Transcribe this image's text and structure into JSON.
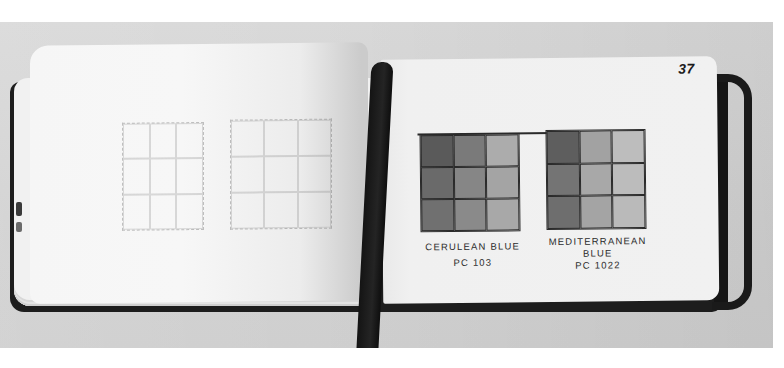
{
  "scene": {
    "description": "Open sketchbook with colored pencil swatch grids",
    "page_number": "37"
  },
  "left_page": {
    "grids": [
      {
        "name": "faint-grid-1",
        "cells": 9
      },
      {
        "name": "faint-grid-2",
        "cells": 9
      }
    ]
  },
  "right_page": {
    "swatches": [
      {
        "name": "cerulean-blue",
        "label_line1": "CERULEAN BLUE",
        "label_line2": "PC 103",
        "cells": [
          "#5a5a5a",
          "#7a7a7a",
          "#acacac",
          "#6a6a6a",
          "#868686",
          "#a4a4a4",
          "#707070",
          "#8a8a8a",
          "#a8a8a8"
        ]
      },
      {
        "name": "mediterranean-blue",
        "label_line1": "MEDITERRANEAN",
        "label_line2": "BLUE",
        "label_line3": "PC 1022",
        "cells": [
          "#5e5e5e",
          "#a2a2a2",
          "#bdbdbd",
          "#747474",
          "#a8a8a8",
          "#bcbcbc",
          "#6e6e6e",
          "#a4a4a4",
          "#bababa"
        ]
      }
    ]
  },
  "colors": {
    "background": "#d5d5d5",
    "page": "#f2f2f2",
    "cover": "#1d1d1d",
    "ink": "#2a2a2a"
  }
}
